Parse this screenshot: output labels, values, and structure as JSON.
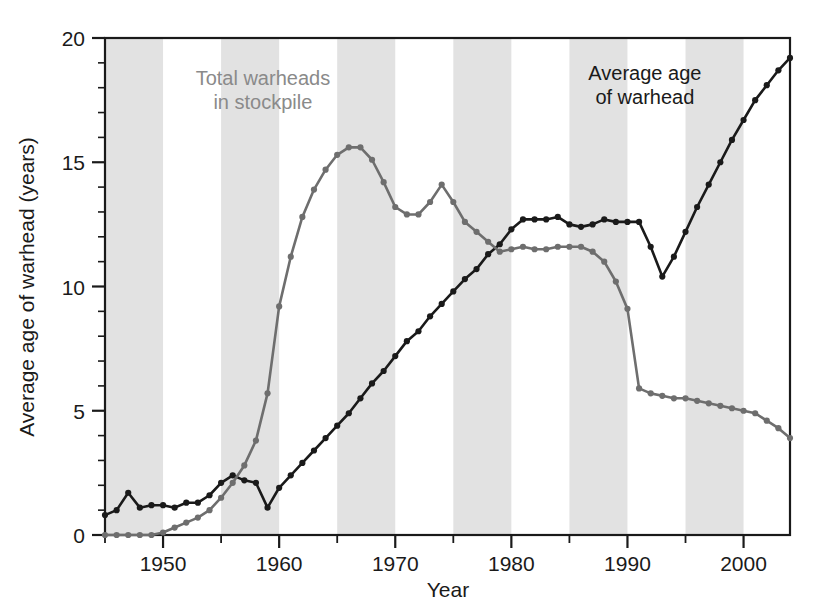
{
  "chart_data": {
    "type": "line",
    "title": "",
    "xlabel": "Year",
    "ylabel": "Average age of warhead (years)",
    "xlim": [
      1945,
      2004
    ],
    "ylim": [
      0,
      20
    ],
    "xticks": [
      1950,
      1960,
      1970,
      1980,
      1990,
      2000
    ],
    "xtick_labels": [
      "1950",
      "1960",
      "1970",
      "1980",
      "1990",
      "2000"
    ],
    "yticks": [
      0,
      5,
      10,
      15,
      20
    ],
    "ytick_labels": [
      "0",
      "5",
      "10",
      "15",
      "20"
    ],
    "minor_ytick_step": 1,
    "minor_xtick_step": 5,
    "grid": false,
    "legend_position": "inline-annotations",
    "band_shading": {
      "color": "#e2e2e2",
      "note": "alternating 5-year vertical gray bands",
      "intervals": [
        [
          1945,
          1950
        ],
        [
          1955,
          1960
        ],
        [
          1965,
          1970
        ],
        [
          1975,
          1980
        ],
        [
          1985,
          1990
        ],
        [
          1995,
          2000
        ]
      ]
    },
    "series": [
      {
        "name": "Average age of warhead",
        "color": "#1a1a1a",
        "marker": "circle",
        "x": [
          1945,
          1946,
          1947,
          1948,
          1949,
          1950,
          1951,
          1952,
          1953,
          1954,
          1955,
          1956,
          1957,
          1958,
          1959,
          1960,
          1961,
          1962,
          1963,
          1964,
          1965,
          1966,
          1967,
          1968,
          1969,
          1970,
          1971,
          1972,
          1973,
          1974,
          1975,
          1976,
          1977,
          1978,
          1979,
          1980,
          1981,
          1982,
          1983,
          1984,
          1985,
          1986,
          1987,
          1988,
          1989,
          1990,
          1991,
          1992,
          1993,
          1994,
          1995,
          1996,
          1997,
          1998,
          1999,
          2000,
          2001,
          2002,
          2003,
          2004
        ],
        "y": [
          0.8,
          1.0,
          1.7,
          1.1,
          1.2,
          1.2,
          1.1,
          1.3,
          1.3,
          1.6,
          2.1,
          2.4,
          2.2,
          2.1,
          1.1,
          1.9,
          2.4,
          2.9,
          3.4,
          3.9,
          4.4,
          4.9,
          5.5,
          6.1,
          6.6,
          7.2,
          7.8,
          8.2,
          8.8,
          9.3,
          9.8,
          10.3,
          10.7,
          11.3,
          11.7,
          12.3,
          12.7,
          12.7,
          12.7,
          12.8,
          12.5,
          12.4,
          12.5,
          12.7,
          12.6,
          12.6,
          12.6,
          11.6,
          10.4,
          11.2,
          12.2,
          13.2,
          14.1,
          15.0,
          15.9,
          16.7,
          17.5,
          18.1,
          18.7,
          19.2
        ]
      },
      {
        "name": "Total warheads in stockpile",
        "color": "#6e6e6e",
        "marker": "circle",
        "x": [
          1945,
          1946,
          1947,
          1948,
          1949,
          1950,
          1951,
          1952,
          1953,
          1954,
          1955,
          1956,
          1957,
          1958,
          1959,
          1960,
          1961,
          1962,
          1963,
          1964,
          1965,
          1966,
          1967,
          1968,
          1969,
          1970,
          1971,
          1972,
          1973,
          1974,
          1975,
          1976,
          1977,
          1978,
          1979,
          1980,
          1981,
          1982,
          1983,
          1984,
          1985,
          1986,
          1987,
          1988,
          1989,
          1990,
          1991,
          1992,
          1993,
          1994,
          1995,
          1996,
          1997,
          1998,
          1999,
          2000,
          2001,
          2002,
          2003,
          2004
        ],
        "y": [
          0.0,
          0.0,
          0.0,
          0.0,
          0.0,
          0.1,
          0.3,
          0.5,
          0.7,
          1.0,
          1.5,
          2.1,
          2.8,
          3.8,
          5.7,
          9.2,
          11.2,
          12.8,
          13.9,
          14.7,
          15.3,
          15.6,
          15.6,
          15.1,
          14.2,
          13.2,
          12.9,
          12.9,
          13.4,
          14.1,
          13.4,
          12.6,
          12.2,
          11.8,
          11.4,
          11.5,
          11.6,
          11.5,
          11.5,
          11.6,
          11.6,
          11.6,
          11.4,
          11.0,
          10.2,
          9.1,
          5.9,
          5.7,
          5.6,
          5.5,
          5.5,
          5.4,
          5.3,
          5.2,
          5.1,
          5.0,
          4.9,
          4.6,
          4.3,
          3.9
        ]
      }
    ],
    "annotations": [
      {
        "text_line1": "Total warheads",
        "text_line2": "in stockpile",
        "color": "#8a8a8a",
        "x": 1958.6,
        "y": 18.1
      },
      {
        "text_line1": "Average age",
        "text_line2": "of warhead",
        "color": "#1a1a1a",
        "x": 1991.5,
        "y": 18.3
      }
    ]
  },
  "axes": {
    "x_axis_label": "Year",
    "y_axis_label": "Average age of warhead (years)"
  },
  "colors": {
    "series_black": "#1a1a1a",
    "series_gray": "#6e6e6e",
    "band_gray": "#e2e2e2",
    "axis": "#1a1a1a",
    "annotation_gray": "#8a8a8a",
    "background": "#ffffff"
  }
}
